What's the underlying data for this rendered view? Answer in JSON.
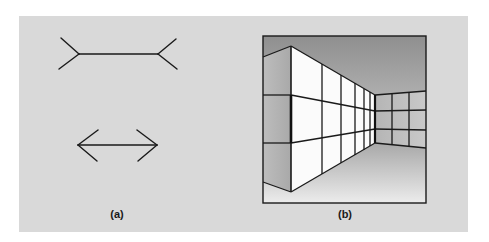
{
  "figure": {
    "panel_background": "#d9d9d9",
    "line_color": "#1a1a1a",
    "panels": [
      {
        "id": "a",
        "caption": "(a)",
        "description": "Müller-Lyer illusion: upper line with outward-pointing fins, lower line with inward-pointing arrowheads"
      },
      {
        "id": "b",
        "caption": "(b)",
        "description": "Perspective corridor drawing showing Müller-Lyer illusion in a room corner context"
      }
    ]
  }
}
